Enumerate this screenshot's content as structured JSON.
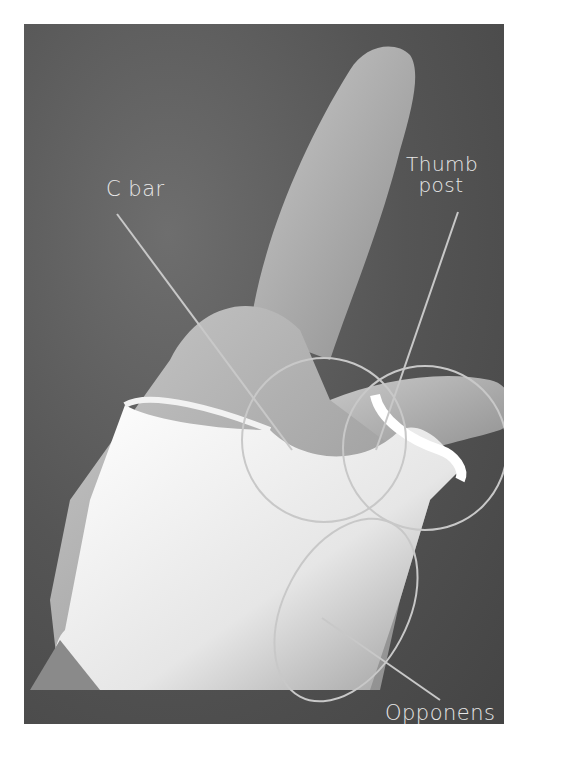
{
  "figure": {
    "labels": {
      "c_bar": "C bar",
      "thumb_post_line1": "Thumb",
      "thumb_post_line2": "post",
      "opponens_bar": "Opponens bar"
    },
    "colors": {
      "background": "#4f4f4f",
      "annotation": "#c8c8c8",
      "label_text": "#e8e8e8",
      "splint": "#f2f2f2",
      "skin": "#b8b8b8"
    }
  }
}
